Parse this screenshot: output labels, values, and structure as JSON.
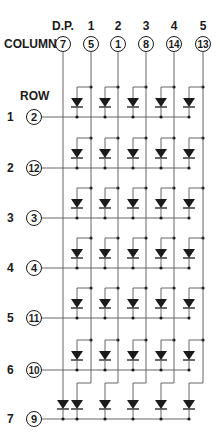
{
  "diagram": {
    "type": "led-dot-matrix-schematic",
    "column_heading": "COLUMN",
    "row_heading": "ROW",
    "colors": {
      "ink": "#1a1a1a",
      "line": "#555555",
      "background": "#ffffff"
    },
    "columns": [
      {
        "label": "D.P.",
        "pin": "7",
        "x": 63
      },
      {
        "label": "1",
        "pin": "5",
        "x": 91
      },
      {
        "label": "2",
        "pin": "1",
        "x": 118
      },
      {
        "label": "3",
        "pin": "8",
        "x": 146
      },
      {
        "label": "4",
        "pin": "14",
        "x": 174
      },
      {
        "label": "5",
        "pin": "13",
        "x": 203
      }
    ],
    "rows": [
      {
        "label": "1",
        "pin": "2",
        "y": 117
      },
      {
        "label": "2",
        "pin": "12",
        "y": 168
      },
      {
        "label": "3",
        "pin": "3",
        "y": 218
      },
      {
        "label": "4",
        "pin": "4",
        "y": 268
      },
      {
        "label": "5",
        "pin": "11",
        "y": 318
      },
      {
        "label": "6",
        "pin": "10",
        "y": 370
      },
      {
        "label": "7",
        "pin": "9",
        "y": 419
      }
    ],
    "diode_x": [
      77,
      105,
      133,
      161,
      189
    ],
    "dp_diode": {
      "column": "D.P.",
      "row": "7"
    }
  }
}
